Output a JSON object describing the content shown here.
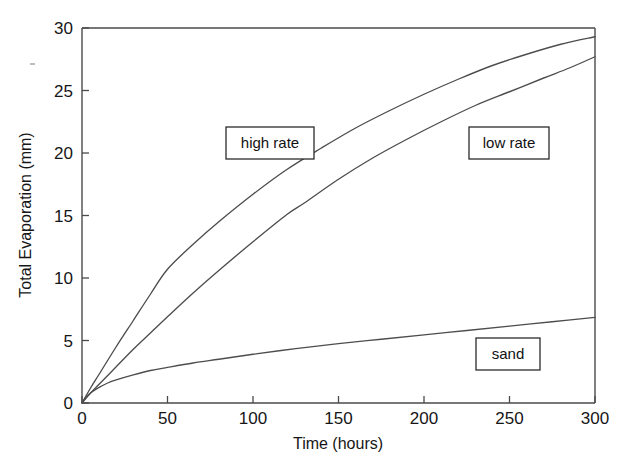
{
  "chart_data": {
    "type": "line",
    "title": "",
    "xlabel": "Time (hours)",
    "ylabel": "Total Evaporation (mm)",
    "xlim": [
      0,
      300
    ],
    "ylim": [
      0,
      30
    ],
    "xticks": [
      0,
      50,
      100,
      150,
      200,
      250,
      300
    ],
    "yticks": [
      0,
      5,
      10,
      15,
      20,
      25,
      30
    ],
    "xtick_labels": [
      "0",
      "50",
      "100",
      "150",
      "200",
      "250",
      "300"
    ],
    "ytick_labels": [
      "0",
      "5",
      "10",
      "15",
      "20",
      "25",
      "30"
    ],
    "grid": false,
    "legend": "inline-annotation-boxes",
    "line_color": "#4d4d4d",
    "axis_color": "#4a4a4a",
    "background": "#ffffff",
    "series": [
      {
        "name": "high rate",
        "label": "high rate",
        "x": [
          0,
          5,
          10,
          20,
          30,
          40,
          50,
          65,
          80,
          100,
          120,
          140,
          160,
          180,
          200,
          220,
          240,
          260,
          280,
          300
        ],
        "values": [
          0,
          1.2,
          2.3,
          4.5,
          6.6,
          8.7,
          10.7,
          12.7,
          14.5,
          16.7,
          18.7,
          20.4,
          22.0,
          23.4,
          24.7,
          25.9,
          27.0,
          27.9,
          28.7,
          29.3
        ]
      },
      {
        "name": "low rate",
        "label": "low rate",
        "x": [
          0,
          5,
          10,
          20,
          30,
          40,
          50,
          65,
          80,
          100,
          120,
          130,
          150,
          170,
          190,
          210,
          230,
          250,
          270,
          285,
          300
        ],
        "values": [
          0,
          0.8,
          1.5,
          2.9,
          4.3,
          5.6,
          6.9,
          8.8,
          10.6,
          12.9,
          15.1,
          16.0,
          17.9,
          19.6,
          21.1,
          22.5,
          23.8,
          24.9,
          26.0,
          26.8,
          27.7
        ]
      },
      {
        "name": "sand",
        "label": "sand",
        "x": [
          0,
          3,
          6,
          10,
          15,
          20,
          30,
          40,
          50,
          65,
          80,
          100,
          125,
          150,
          175,
          200,
          225,
          250,
          275,
          300
        ],
        "values": [
          0,
          0.55,
          0.9,
          1.25,
          1.6,
          1.85,
          2.25,
          2.6,
          2.85,
          3.2,
          3.5,
          3.9,
          4.35,
          4.75,
          5.1,
          5.45,
          5.8,
          6.15,
          6.5,
          6.85
        ]
      }
    ],
    "annotations": [
      {
        "name": "high-rate-label",
        "text": "high rate",
        "cx": 270,
        "cy": 143,
        "w": 88,
        "h": 32
      },
      {
        "name": "low-rate-label",
        "text": "low rate",
        "cx": 509,
        "cy": 143,
        "w": 80,
        "h": 32
      },
      {
        "name": "sand-label",
        "text": "sand",
        "cx": 508,
        "cy": 354,
        "w": 64,
        "h": 32
      }
    ]
  }
}
